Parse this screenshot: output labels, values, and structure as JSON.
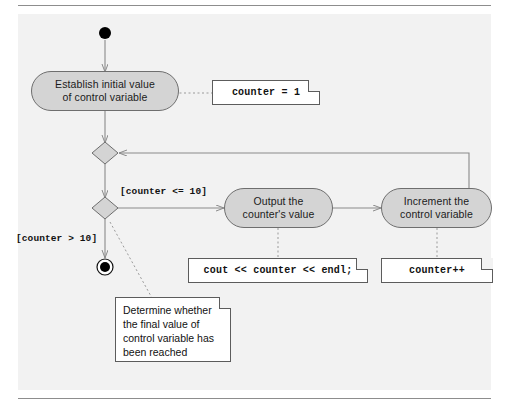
{
  "diagram": {
    "colors": {
      "panel_background": "#f2f2f2",
      "activity_fill": "#d4d4d4",
      "activity_border": "#6e6e6e",
      "note_fill": "#ffffff",
      "note_border": "#5c5c5c",
      "connector": "#8a8a8a",
      "node_fill": "#000000",
      "rule": "#8d8d8d"
    },
    "nodes": {
      "initial": {
        "name": "initial-node",
        "shape": "filled-circle"
      },
      "final": {
        "name": "final-node",
        "shape": "bullseye"
      },
      "merge": {
        "name": "merge-diamond",
        "shape": "diamond"
      },
      "decision": {
        "name": "decision-diamond",
        "shape": "diamond"
      }
    },
    "activities": [
      {
        "id": "establish",
        "line1": "Establish initial value",
        "line2": "of control variable"
      },
      {
        "id": "output",
        "line1": "Output the",
        "line2": "counter's value"
      },
      {
        "id": "increment",
        "line1": "Increment the",
        "line2": "control variable"
      }
    ],
    "guards": [
      {
        "id": "guard-true",
        "text": "[counter <= 10]"
      },
      {
        "id": "guard-false",
        "text": "[counter > 10]"
      }
    ],
    "notes": {
      "init_code": "counter = 1",
      "output_code": "cout << counter << endl;",
      "increment_code": "counter++",
      "decision_note": {
        "line1": "Determine whether",
        "line2": "the final value of",
        "line3": "control variable has",
        "line4": "been reached"
      }
    }
  }
}
